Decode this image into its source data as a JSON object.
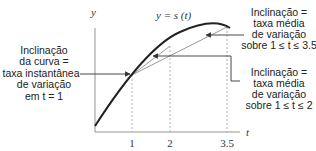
{
  "axes": {
    "y_label": "y",
    "x_label": "t",
    "curve_label": "y = s (t)"
  },
  "ticks": [
    {
      "value": 1,
      "label": "1"
    },
    {
      "value": 2,
      "label": "2"
    },
    {
      "value": 3.5,
      "label": "3.5"
    }
  ],
  "annotations": {
    "instantaneous": {
      "lines": [
        "Inclinação",
        "da curva =",
        "taxa instantânea",
        "de variação",
        "em t = 1"
      ]
    },
    "average_long": {
      "lines": [
        "Inclinação =",
        "taxa média",
        "de variação",
        "sobre 1 ≤ t ≤ 3.5"
      ]
    },
    "average_short": {
      "lines": [
        "Inclinação =",
        "taxa média",
        "de variação",
        "sobre 1 ≤ t ≤ 2"
      ]
    }
  }
}
